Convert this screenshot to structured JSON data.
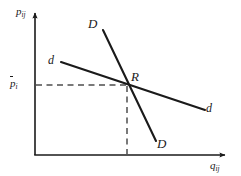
{
  "figure": {
    "background_color": "#ffffff",
    "line_color": "#1a1a1a",
    "dash_color": "#555555",
    "width": 241,
    "height": 176
  },
  "axes": {
    "y_axis": {
      "name": "price-axis",
      "label": "p",
      "label_subscript": "ij",
      "origin_px": {
        "x": 35,
        "y": 155
      },
      "tip_px": {
        "x": 35,
        "y": 10
      },
      "arrow": true
    },
    "x_axis": {
      "name": "quantity-axis",
      "label": "q",
      "label_subscript": "ij",
      "origin_px": {
        "x": 35,
        "y": 155
      },
      "tip_px": {
        "x": 229,
        "y": 155
      },
      "arrow": true
    },
    "tick": {
      "name": "equilibrium-price-tick",
      "label": "p",
      "label_subscript": "i",
      "overbar": true,
      "y_px": 85
    }
  },
  "curves": [
    {
      "name": "steep-demand-curve",
      "id": "curve-D",
      "label": "D",
      "label_top": "D",
      "label_bottom": "D",
      "description": "steep downward-sloping demand curve D-D",
      "start_px": {
        "x": 103,
        "y": 30
      },
      "end_px": {
        "x": 156,
        "y": 141
      },
      "stroke_width": 2.1
    },
    {
      "name": "flat-demand-curve",
      "id": "curve-d",
      "label": "d",
      "label_left": "d",
      "label_right": "d",
      "description": "shallow downward-sloping demand curve d-d",
      "start_px": {
        "x": 61,
        "y": 62
      },
      "end_px": {
        "x": 205,
        "y": 110
      },
      "stroke_width": 2.1
    }
  ],
  "intersection": {
    "name": "equilibrium-point",
    "label": "R",
    "x_px": 127,
    "y_px": 85
  },
  "guides": [
    {
      "name": "horizontal-price-guide",
      "orientation": "horizontal",
      "from_px": {
        "x": 36,
        "y": 85
      },
      "to_px": {
        "x": 127,
        "y": 85
      },
      "style": "dashed"
    },
    {
      "name": "vertical-quantity-guide",
      "orientation": "vertical",
      "from_px": {
        "x": 127,
        "y": 85
      },
      "to_px": {
        "x": 127,
        "y": 155
      },
      "style": "dashed"
    }
  ]
}
